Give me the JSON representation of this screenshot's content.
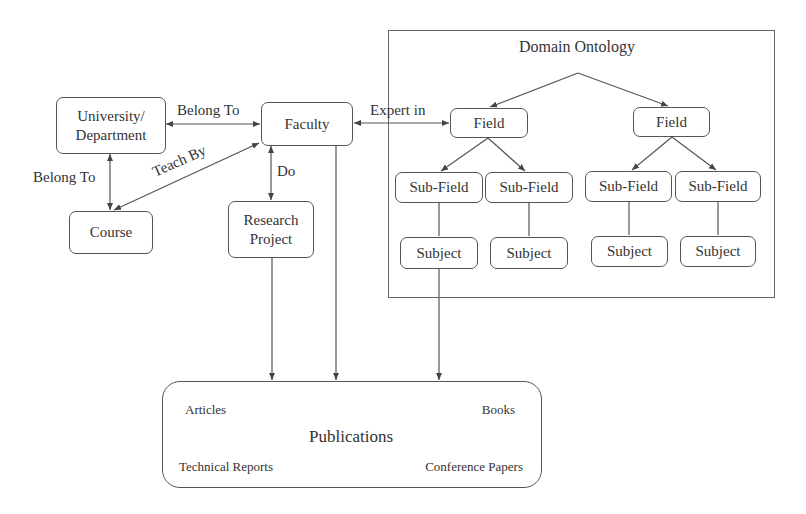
{
  "nodes": {
    "university": "University/ Department",
    "faculty": "Faculty",
    "course": "Course",
    "research_project": "Research Project",
    "publications": "Publications"
  },
  "edges": {
    "uni_faculty": "Belong To",
    "uni_course": "Belong To",
    "course_faculty": "Teach By",
    "faculty_research": "Do",
    "faculty_field": "Expert in"
  },
  "ontology": {
    "title": "Domain Ontology",
    "fields": [
      {
        "label": "Field",
        "subfields": [
          {
            "label": "Sub-Field",
            "subject": "Subject"
          },
          {
            "label": "Sub-Field",
            "subject": "Subject"
          }
        ]
      },
      {
        "label": "Field",
        "subfields": [
          {
            "label": "Sub-Field",
            "subject": "Subject"
          },
          {
            "label": "Sub-Field",
            "subject": "Subject"
          }
        ]
      }
    ]
  },
  "publication_types": {
    "top_left": "Articles",
    "top_right": "Books",
    "bottom_left": "Technical Reports",
    "bottom_right": "Conference Papers"
  }
}
